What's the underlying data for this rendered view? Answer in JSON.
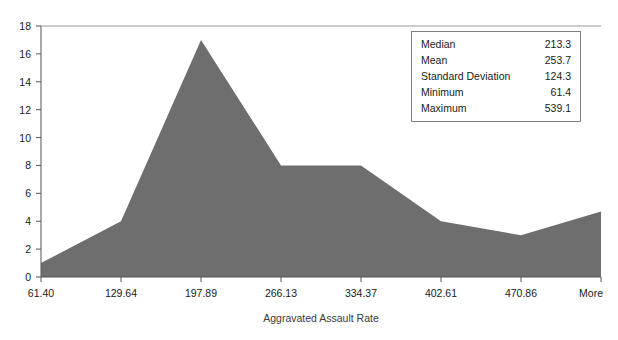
{
  "chart_data": {
    "type": "area",
    "title": "",
    "xlabel": "Aggravated Assault Rate",
    "ylabel": "",
    "categories": [
      "61.40",
      "129.64",
      "197.89",
      "266.13",
      "334.37",
      "402.61",
      "470.86",
      "More"
    ],
    "values": [
      1,
      4,
      17,
      8,
      8,
      4,
      3,
      4.7
    ],
    "ylim": [
      0,
      18
    ],
    "yticks": [
      0,
      2,
      4,
      6,
      8,
      10,
      12,
      14,
      16,
      18
    ],
    "ytick_labels": [
      "0",
      "2",
      "4",
      "6",
      "8",
      "10",
      "12",
      "14",
      "16",
      "18"
    ],
    "grid": false,
    "legend": "none",
    "series": [
      {
        "name": "Frequency",
        "values": [
          1,
          4,
          17,
          8,
          8,
          4,
          3,
          4.7
        ]
      }
    ],
    "colors": {
      "fill": "#6e6e6e",
      "axis": "#555555",
      "text": "#1a1a1a",
      "box_border": "#808080"
    }
  },
  "stats_box": {
    "rows": [
      {
        "label": "Median",
        "value": "213.3"
      },
      {
        "label": "Mean",
        "value": "253.7"
      },
      {
        "label": "Standard Deviation",
        "value": "124.3"
      },
      {
        "label": "Minimum",
        "value": "61.4"
      },
      {
        "label": "Maximum",
        "value": "539.1"
      }
    ]
  },
  "axis": {
    "x_tick_labels": [
      "61.40",
      "129.64",
      "197.89",
      "266.13",
      "334.37",
      "402.61",
      "470.86",
      "More"
    ],
    "y_tick_labels": [
      "18",
      "16",
      "14",
      "12",
      "10",
      "8",
      "6",
      "4",
      "2",
      "0"
    ],
    "x_title": "Aggravated Assault Rate"
  }
}
